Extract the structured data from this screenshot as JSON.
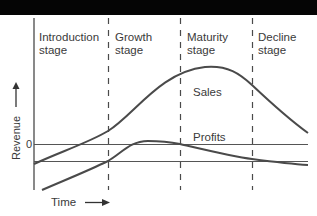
{
  "diagram": {
    "stages": [
      {
        "line1": "Introduction",
        "line2": "stage"
      },
      {
        "line1": "Growth",
        "line2": "stage"
      },
      {
        "line1": "Maturity",
        "line2": "stage"
      },
      {
        "line1": "Decline",
        "line2": "stage"
      }
    ],
    "curves": {
      "sales_label": "Sales",
      "profits_label": "Profits"
    },
    "axes": {
      "y_label": "Revenue",
      "x_label": "Time",
      "zero_tick": "0"
    },
    "colors": {
      "line": "#4a4a4a",
      "text": "#3a3a3a",
      "top_band": "#050505"
    }
  }
}
